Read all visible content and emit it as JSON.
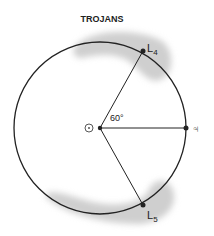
{
  "diagram": {
    "title": "TROJANS",
    "angle_label": "60°",
    "sun_symbol": "☉",
    "jupiter_symbol": "♃",
    "points": [
      {
        "id": "L4",
        "label": "L",
        "sub": "4"
      },
      {
        "id": "L5",
        "label": "L",
        "sub": "5"
      }
    ],
    "colors": {
      "line": "#222222",
      "cloud": "#cfcfcf"
    }
  }
}
